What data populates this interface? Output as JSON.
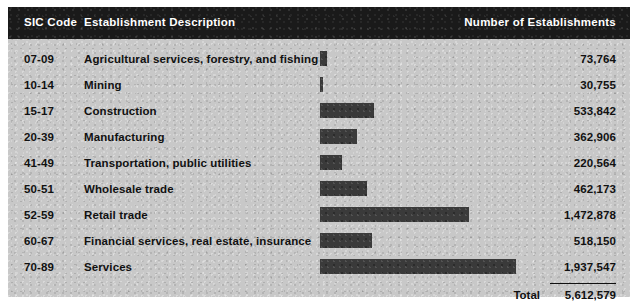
{
  "header": {
    "col_sic": "SIC Code",
    "col_description": "Establishment Description",
    "col_number": "Number of Establishments"
  },
  "total": {
    "label": "Total",
    "value": "5,612,579"
  },
  "chart_data": {
    "type": "bar",
    "title": "",
    "xlabel": "",
    "ylabel": "",
    "orientation": "horizontal",
    "grid": false,
    "legend": false,
    "axis_max": 1937547,
    "categories": [
      "Agricultural services, forestry, and fishing",
      "Mining",
      "Construction",
      "Manufacturing",
      "Transportation, public utilities",
      "Wholesale trade",
      "Retail trade",
      "Financial services, real estate, insurance",
      "Services"
    ],
    "codes": [
      "07-09",
      "10-14",
      "15-17",
      "20-39",
      "41-49",
      "50-51",
      "52-59",
      "60-67",
      "70-89"
    ],
    "values": [
      73764,
      30755,
      533842,
      362906,
      220564,
      462173,
      1472878,
      518150,
      1937547
    ],
    "value_labels": [
      "73,764",
      "30,755",
      "533,842",
      "362,906",
      "220,564",
      "462,173",
      "1,472,878",
      "518,150",
      "1,937,547"
    ],
    "total": 5612579,
    "total_label": "5,612,579"
  },
  "rows": [
    {
      "code": "07-09",
      "description": "Agricultural services, forestry, and fishing",
      "value": 73764,
      "value_label": "73,764"
    },
    {
      "code": "10-14",
      "description": "Mining",
      "value": 30755,
      "value_label": "30,755"
    },
    {
      "code": "15-17",
      "description": "Construction",
      "value": 533842,
      "value_label": "533,842"
    },
    {
      "code": "20-39",
      "description": "Manufacturing",
      "value": 362906,
      "value_label": "362,906"
    },
    {
      "code": "41-49",
      "description": "Transportation, public utilities",
      "value": 220564,
      "value_label": "220,564"
    },
    {
      "code": "50-51",
      "description": "Wholesale trade",
      "value": 462173,
      "value_label": "462,173"
    },
    {
      "code": "52-59",
      "description": "Retail trade",
      "value": 1472878,
      "value_label": "1,472,878"
    },
    {
      "code": "60-67",
      "description": "Financial services, real estate, insurance",
      "value": 518150,
      "value_label": "518,150"
    },
    {
      "code": "70-89",
      "description": "Services",
      "value": 1937547,
      "value_label": "1,937,547"
    }
  ],
  "layout": {
    "bar_left_px": 312,
    "bar_max_px": 196,
    "row_start_y": 40,
    "row_step_y": 26
  }
}
